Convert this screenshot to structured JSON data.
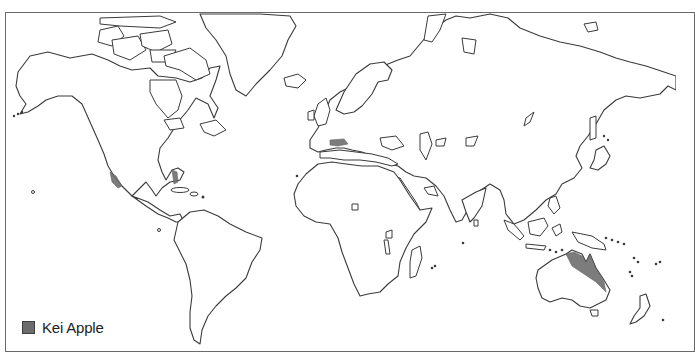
{
  "map": {
    "title": "",
    "type": "world outline distribution map",
    "colors": {
      "land_fill": "#ffffff",
      "coastline": "#3a3a3a",
      "range_fill": "#6e6e6e",
      "frame": "#6a6a6a",
      "background": "#ffffff"
    },
    "highlighted_regions": [
      {
        "name": "Western Mexico / Baja California",
        "species": "Kei Apple"
      },
      {
        "name": "Florida",
        "species": "Kei Apple"
      },
      {
        "name": "Southern France / Mediterranean coast",
        "species": "Kei Apple"
      },
      {
        "name": "Northeastern Australia (Queensland)",
        "species": "Kei Apple"
      }
    ]
  },
  "legend": {
    "items": [
      {
        "label": "Kei Apple",
        "color": "#6c6c6c",
        "icon": "filled-square-swatch"
      }
    ]
  }
}
